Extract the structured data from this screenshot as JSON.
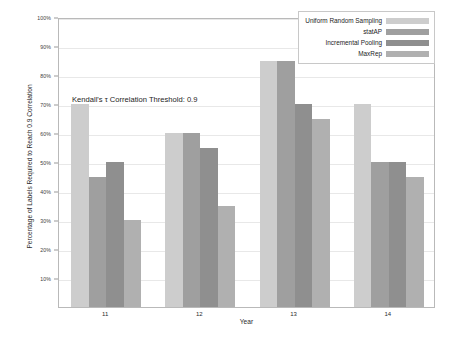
{
  "chart_data": {
    "type": "bar",
    "title": "",
    "xlabel": "Year",
    "ylabel": "Percentage of Labels Required to Reach 0.9 Correlation",
    "categories": [
      "11",
      "12",
      "13",
      "14"
    ],
    "ylim": [
      0,
      100
    ],
    "y_tick_labels": [
      "10%",
      "20%",
      "30%",
      "40%",
      "50%",
      "60%",
      "70%",
      "80%",
      "90%",
      "100%"
    ],
    "y_tick_values": [
      10,
      20,
      30,
      40,
      50,
      60,
      70,
      80,
      90,
      100
    ],
    "grid": true,
    "legend_position": "top-right",
    "annotation": "Kendall's τ Correlation Threshold: 0.9",
    "series": [
      {
        "name": "Uniform Random Sampling",
        "color": "#cdcdcd",
        "values": [
          70,
          60,
          85,
          70
        ]
      },
      {
        "name": "statAP",
        "color": "#9f9f9f",
        "values": [
          45,
          60,
          85,
          50
        ]
      },
      {
        "name": "Incremental Pooling",
        "color": "#8f8f8f",
        "values": [
          50,
          55,
          70,
          50
        ]
      },
      {
        "name": "MaxRep",
        "color": "#b0b0b0",
        "values": [
          30,
          35,
          65,
          45
        ]
      }
    ]
  },
  "axis": {
    "y_title": "Percentage of Labels Required to Reach 0.9 Correlation",
    "x_title": "Year"
  },
  "annotation": {
    "text": "Kendall's τ Correlation Threshold: 0.9"
  },
  "legend": {
    "entries": [
      {
        "label": "Uniform Random Sampling",
        "color": "#cdcdcd"
      },
      {
        "label": "statAP",
        "color": "#9f9f9f"
      },
      {
        "label": "Incremental Pooling",
        "color": "#8f8f8f"
      },
      {
        "label": "MaxRep",
        "color": "#b0b0b0"
      }
    ]
  }
}
